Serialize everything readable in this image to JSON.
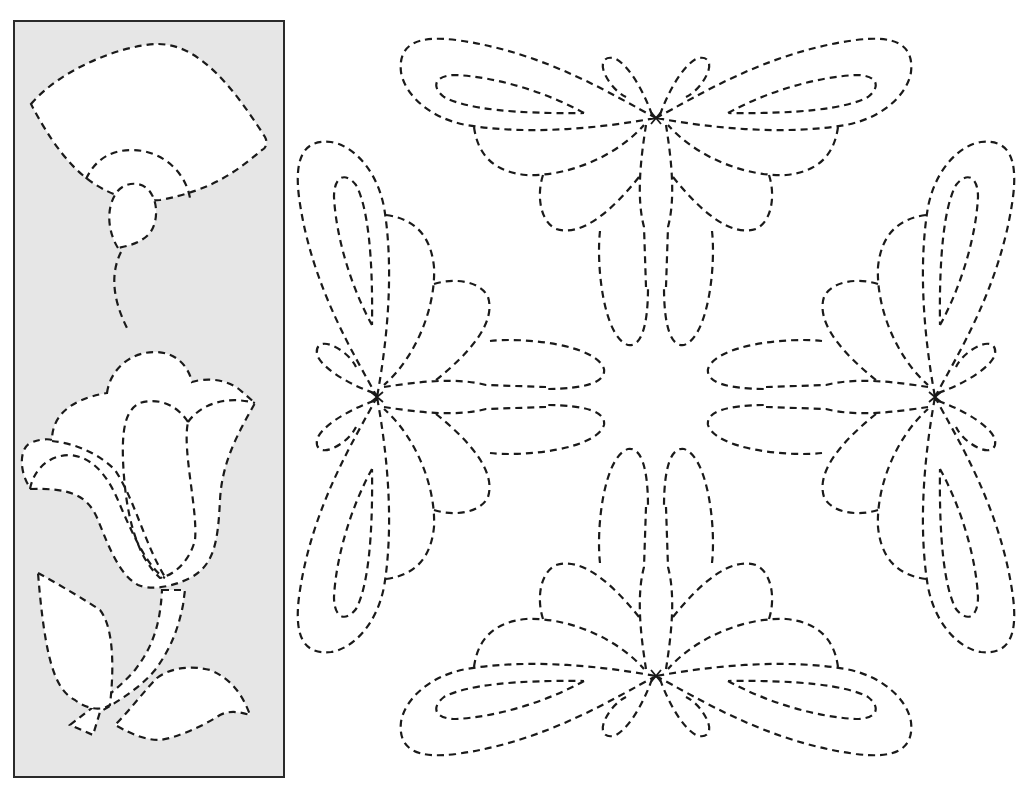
{
  "title": "Quilting stencil patterns",
  "panel": {
    "label": "Fan flower and tulip border motifs",
    "background": "#e6e6e6",
    "border_color": "#2a2a2a",
    "motifs": [
      "fan-flower",
      "tulip"
    ]
  },
  "wreath": {
    "label": "Butterfly bow wreath block",
    "motif_count": 4,
    "symmetry": "4-fold rotational"
  },
  "line_style": {
    "stroke": "#1a1a1a",
    "dash": "dashed"
  }
}
